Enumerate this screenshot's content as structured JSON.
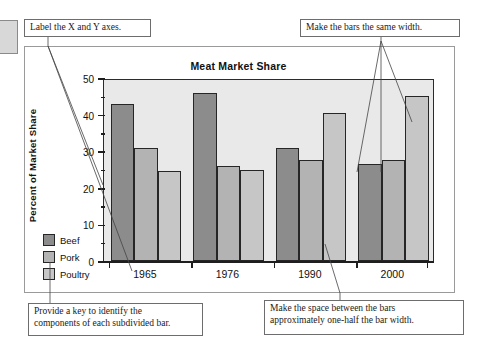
{
  "callouts": {
    "axes": "Label the X and Y axes.",
    "bar_width": "Make the bars the same width.",
    "key": "Provide a key to identify the\ncomponents of each subdivided bar.",
    "spacing": "Make the space between the bars\napproximately one-half the bar width."
  },
  "colors": {
    "beef": "#8c8c8c",
    "pork": "#b3b3b3",
    "poultry": "#c6c6c6",
    "plot_background": "#e9e9e9",
    "axis": "#1e1e1e",
    "frame": "#9a9a9a"
  },
  "chart_data": {
    "type": "bar",
    "title": "Meat Market Share",
    "xlabel": "",
    "ylabel": "Percent of Market Share",
    "categories": [
      "1965",
      "1976",
      "1990",
      "2000"
    ],
    "series": [
      {
        "name": "Beef",
        "values": [
          43,
          46,
          31,
          26.5
        ]
      },
      {
        "name": "Pork",
        "values": [
          31,
          26,
          27.5,
          27.5
        ]
      },
      {
        "name": "Poultry",
        "values": [
          24.5,
          25,
          40.5,
          45
        ]
      }
    ],
    "ylim": [
      0,
      50
    ],
    "yticks": [
      0,
      10,
      20,
      30,
      40,
      50
    ],
    "ytick_labels": [
      "0",
      "10",
      "20",
      "30",
      "40",
      "50"
    ],
    "yticks_minor": [
      5,
      15,
      25,
      35,
      45
    ],
    "grid": false,
    "legend_position": "lower-left-outside"
  },
  "legend": {
    "items": [
      {
        "label": "Beef"
      },
      {
        "label": "Pork"
      },
      {
        "label": "Poultry"
      }
    ]
  }
}
